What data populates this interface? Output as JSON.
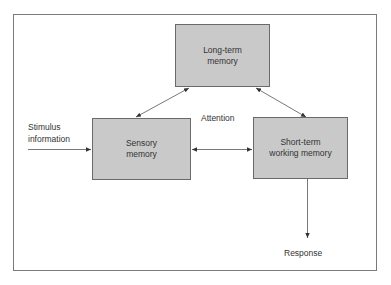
{
  "diagram": {
    "nodes": {
      "long_term": {
        "label_line1": "Long-term",
        "label_line2": "memory"
      },
      "sensory": {
        "label_line1": "Sensory",
        "label_line2": "memory"
      },
      "short_term": {
        "label_line1": "Short-term",
        "label_line2": "working memory"
      }
    },
    "labels": {
      "stimulus_line1": "Stimulus",
      "stimulus_line2": "information",
      "attention": "Attention",
      "response": "Response"
    },
    "edges": [
      {
        "from": "stimulus",
        "to": "sensory",
        "direction": "forward"
      },
      {
        "from": "sensory",
        "to": "long_term",
        "direction": "both"
      },
      {
        "from": "short_term",
        "to": "long_term",
        "direction": "both"
      },
      {
        "from": "sensory",
        "to": "short_term",
        "direction": "both",
        "label": "Attention"
      },
      {
        "from": "short_term",
        "to": "response",
        "direction": "forward"
      }
    ],
    "colors": {
      "box_fill": "#c9c9c9",
      "stroke": "#555555",
      "text": "#333333"
    }
  }
}
